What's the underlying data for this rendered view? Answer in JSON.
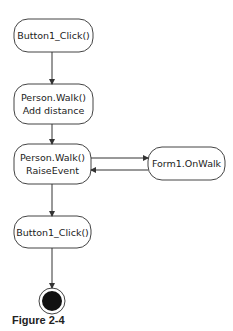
{
  "diagram": {
    "type": "activity-flow",
    "nodes": [
      {
        "id": "n1",
        "lines": [
          "Button1_Click()"
        ]
      },
      {
        "id": "n2",
        "lines": [
          "Person.Walk()",
          "Add distance"
        ]
      },
      {
        "id": "n3",
        "lines": [
          "Person.Walk()",
          "RaiseEvent"
        ]
      },
      {
        "id": "n4",
        "lines": [
          "Form1.OnWalk"
        ]
      },
      {
        "id": "n5",
        "lines": [
          "Button1_Click()"
        ]
      },
      {
        "id": "end",
        "type": "final-state"
      }
    ],
    "edges": [
      {
        "from": "n1",
        "to": "n2"
      },
      {
        "from": "n2",
        "to": "n3"
      },
      {
        "from": "n3",
        "to": "n4"
      },
      {
        "from": "n4",
        "to": "n3"
      },
      {
        "from": "n3",
        "to": "n5"
      },
      {
        "from": "n5",
        "to": "end"
      }
    ],
    "caption": "Figure 2-4"
  }
}
